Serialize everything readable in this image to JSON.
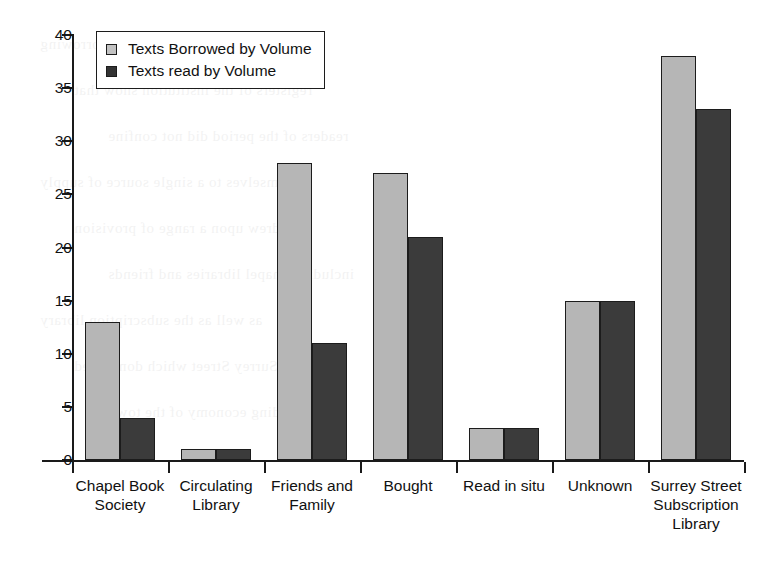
{
  "chart_data": {
    "type": "bar",
    "title": "",
    "subtitle": "",
    "xlabel": "",
    "ylabel": "",
    "ylim": [
      0,
      40
    ],
    "ytick_step": 5,
    "yticks": [
      0,
      5,
      10,
      15,
      20,
      25,
      30,
      35,
      40
    ],
    "grid": false,
    "legend_position": "top-left",
    "categories": [
      "Chapel Book Society",
      "Circulating Library",
      "Friends and Family",
      "Bought",
      "Read in situ",
      "Unknown",
      "Surrey Street Subscription Library"
    ],
    "category_label_lines": [
      [
        "Chapel Book",
        "Society"
      ],
      [
        "Circulating",
        "Library"
      ],
      [
        "Friends and",
        "Family"
      ],
      [
        "Bought"
      ],
      [
        "Read in situ"
      ],
      [
        "Unknown"
      ],
      [
        "Surrey Street",
        "Subscription",
        "Library"
      ]
    ],
    "series": [
      {
        "name": "Texts Borrowed by Volume",
        "color": "#b6b6b6",
        "values": [
          13,
          1,
          28,
          27,
          3,
          15,
          38
        ]
      },
      {
        "name": "Texts read by Volume",
        "color": "#3b3b3b",
        "values": [
          4,
          1,
          11,
          21,
          3,
          15,
          33
        ]
      }
    ]
  },
  "legend": {
    "entries": [
      {
        "label": "Texts Borrowed by Volume",
        "swatch": "light-gray-square"
      },
      {
        "label": "Texts read by Volume",
        "swatch": "dark-gray-square"
      }
    ]
  },
  "colors": {
    "series_light": "#b6b6b6",
    "series_dark": "#3b3b3b",
    "axis": "#1a1a1a",
    "text": "#111111",
    "background": "#ffffff"
  },
  "bleed_through": {
    "lines": [
      "the volumes recorded in the borrowing",
      "registers of the institution show that",
      "readers of the period did not confine",
      "themselves to a single source of supply",
      "but drew upon a range of provision",
      "including chapel libraries and friends",
      "as well as the subscription library",
      "in Surrey Street which dominated",
      "the reading economy of the town"
    ]
  }
}
